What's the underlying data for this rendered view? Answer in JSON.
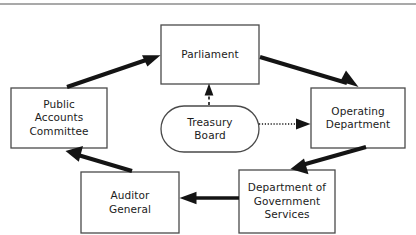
{
  "diagram": {
    "type": "flow-diagram",
    "canvas": {
      "width": 416,
      "height": 235,
      "background": "#ffffff"
    },
    "style": {
      "node_fill": "#ffffff",
      "node_stroke": "#4a4a4a",
      "text_color": "#1b1b1b",
      "arrow_color": "#141414",
      "rule_color": "#8c8c8c"
    },
    "top_rule": {
      "present": true,
      "y": 4
    },
    "nodes": [
      {
        "id": "parliament",
        "label": "Parliament",
        "shape": "rectangle",
        "x": 161,
        "y": 25,
        "width": 98,
        "height": 59
      },
      {
        "id": "public-accounts-committee",
        "label": "Public\nAccounts\nCommittee",
        "shape": "rectangle",
        "x": 11,
        "y": 88,
        "width": 96,
        "height": 60
      },
      {
        "id": "operating-department",
        "label": "Operating\nDepartment",
        "shape": "rectangle",
        "x": 311,
        "y": 88,
        "width": 94,
        "height": 60
      },
      {
        "id": "treasury-board",
        "label": "Treasury\nBoard",
        "shape": "stadium",
        "x": 161,
        "y": 106,
        "width": 98,
        "height": 46
      },
      {
        "id": "auditor-general",
        "label": "Auditor\nGeneral",
        "shape": "rectangle",
        "x": 81,
        "y": 172,
        "width": 98,
        "height": 61
      },
      {
        "id": "department-of-government-services",
        "label": "Department of\nGovernment\nServices",
        "shape": "rectangle",
        "x": 239,
        "y": 170,
        "width": 96,
        "height": 63
      }
    ],
    "edges": [
      {
        "id": "pac-to-parliament",
        "from": "public-accounts-committee",
        "to": "parliament",
        "style": "thick-solid",
        "arrowhead": "filled-triangle"
      },
      {
        "id": "parliament-to-operating-department",
        "from": "parliament",
        "to": "operating-department",
        "style": "thick-solid",
        "arrowhead": "filled-triangle"
      },
      {
        "id": "operating-department-to-dgs",
        "from": "operating-department",
        "to": "department-of-government-services",
        "style": "thick-solid",
        "arrowhead": "filled-triangle"
      },
      {
        "id": "dgs-to-auditor-general",
        "from": "department-of-government-services",
        "to": "auditor-general",
        "style": "thick-solid",
        "arrowhead": "filled-triangle"
      },
      {
        "id": "auditor-general-to-pac",
        "from": "auditor-general",
        "to": "public-accounts-committee",
        "style": "thick-solid",
        "arrowhead": "filled-triangle"
      },
      {
        "id": "treasury-board-to-parliament",
        "from": "treasury-board",
        "to": "parliament",
        "style": "dashed",
        "arrowhead": "filled-triangle"
      },
      {
        "id": "treasury-board-to-operating-department",
        "from": "treasury-board",
        "to": "operating-department",
        "style": "dotted",
        "arrowhead": "filled-triangle"
      }
    ]
  }
}
